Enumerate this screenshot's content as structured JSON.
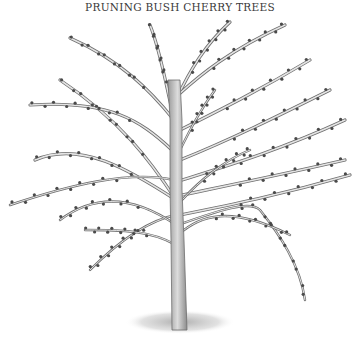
{
  "title": "PRUNING BUSH CHERRY TREES",
  "illustration": {
    "subject": "bush cherry tree with budding branches",
    "colors": {
      "stroke": "#6e6e6e",
      "trunk_fill": "#c9c9c9",
      "bud": "#4a4a4a",
      "ground": "#9a9a9a"
    },
    "trunk": "M172,330 L171,240 L170,190 L170,120 L168,80 L180,80 L182,120 L182,190 L184,240 L187,330 Z",
    "branches": [
      "M176,200 C150,160 120,120 60,80",
      "M176,200 C130,170 80,140 35,160",
      "M172,150 C140,120 110,100 30,105",
      "M174,120 C150,90 120,60 70,38",
      "M172,110 C165,80 160,50 150,25",
      "M176,100 C190,70 205,45 230,22",
      "M178,95 C200,75 230,50 285,25",
      "M180,130 C220,110 260,90 310,60",
      "M180,160 C230,140 280,115 330,90",
      "M182,180 C230,165 280,150 345,120",
      "M182,195 C230,185 280,175 345,160",
      "M180,215 C230,205 280,195 350,175",
      "M178,225 C220,210 250,200 260,210 C280,235 300,265 305,300",
      "M178,235 C200,215 230,205 290,235",
      "M176,215 C150,220 120,240 90,270",
      "M176,225 C140,200 100,190 60,220",
      "M174,180 C130,170 70,185 10,205",
      "M176,245 C150,230 120,230 85,230",
      "M180,150 C190,130 200,110 215,90",
      "M182,200 C200,180 225,160 250,150"
    ],
    "ground": {
      "cx": 180,
      "cy": 322,
      "rx": 55,
      "ry": 12
    }
  }
}
